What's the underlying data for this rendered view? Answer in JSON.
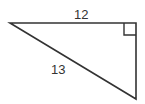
{
  "diagram": {
    "type": "right-triangle",
    "stroke_color": "#333333",
    "background": "#ffffff",
    "vertices": {
      "left": [
        10,
        23
      ],
      "right_angle": [
        136,
        23
      ],
      "bottom": [
        136,
        99
      ]
    },
    "right_angle_marker": {
      "corner": "top-right",
      "size": 11
    },
    "labels": {
      "top_side": "12",
      "hypotenuse": "13"
    }
  }
}
